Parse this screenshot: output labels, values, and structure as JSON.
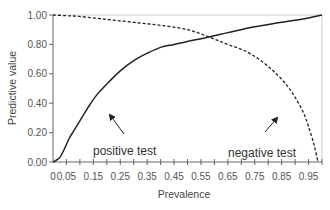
{
  "chart_data": {
    "type": "line",
    "title": "",
    "xlabel": "Prevalence",
    "ylabel": "Predictive value",
    "xlim": [
      0,
      1.0
    ],
    "ylim": [
      0,
      1.0
    ],
    "grid": false,
    "legend": "none (inline annotations)",
    "x_tick_step": 0.05,
    "x_tick_labels": [
      "0",
      "0.05",
      "0.15",
      "0.25",
      "0.35",
      "0.45",
      "0.55",
      "0.65",
      "0.75",
      "0.85",
      "0.95"
    ],
    "y_tick_labels": [
      "0.00",
      "0.20",
      "0.40",
      "0.60",
      "0.80",
      "1.00"
    ],
    "series": [
      {
        "name": "positive test",
        "style": "solid",
        "x": [
          0,
          0.01,
          0.025,
          0.04,
          0.06,
          0.08,
          0.1,
          0.13,
          0.16,
          0.2,
          0.25,
          0.3,
          0.35,
          0.4,
          0.45,
          0.5,
          0.58,
          0.65,
          0.75,
          0.85,
          0.95,
          1.0
        ],
        "values": [
          0,
          0.01,
          0.03,
          0.08,
          0.16,
          0.22,
          0.28,
          0.37,
          0.45,
          0.53,
          0.62,
          0.69,
          0.74,
          0.78,
          0.8,
          0.82,
          0.85,
          0.88,
          0.92,
          0.95,
          0.98,
          1.0
        ]
      },
      {
        "name": "negative test",
        "style": "dashed",
        "x": [
          0,
          0.05,
          0.1,
          0.2,
          0.3,
          0.4,
          0.5,
          0.58,
          0.65,
          0.72,
          0.78,
          0.83,
          0.87,
          0.9,
          0.93,
          0.95,
          0.97,
          0.985
        ],
        "values": [
          1.0,
          0.995,
          0.99,
          0.97,
          0.95,
          0.93,
          0.9,
          0.85,
          0.8,
          0.75,
          0.68,
          0.6,
          0.52,
          0.44,
          0.34,
          0.24,
          0.12,
          0.0
        ]
      }
    ],
    "annotations": [
      {
        "text": "positive test",
        "arrow_to": [
          0.22,
          0.54
        ]
      },
      {
        "text": "negative test",
        "arrow_to": [
          0.8,
          0.56
        ]
      }
    ],
    "crossing_point": {
      "x": 0.58,
      "y": 0.85
    }
  }
}
